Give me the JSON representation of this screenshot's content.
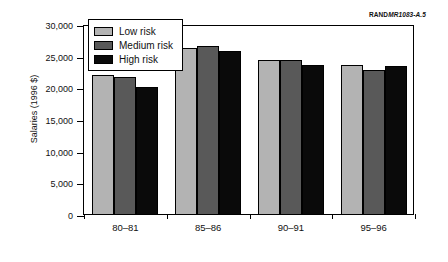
{
  "credit": {
    "publisher": "RAND",
    "code": "MR1083-A.5"
  },
  "legend": {
    "position": "top-left-inside",
    "items": [
      {
        "label": "Low risk",
        "color": "#b3b3b3"
      },
      {
        "label": "Medium risk",
        "color": "#595959"
      },
      {
        "label": "High risk",
        "color": "#0a0a0a"
      }
    ]
  },
  "yaxis": {
    "ticks": [
      "0",
      "5,000",
      "10,000",
      "15,000",
      "20,000",
      "25,000",
      "30,000"
    ]
  },
  "chart_data": {
    "type": "bar",
    "title": "",
    "xlabel": "",
    "ylabel": "Salaries (1996 $)",
    "categories": [
      "80–81",
      "85–86",
      "90–91",
      "95–96"
    ],
    "series": [
      {
        "name": "Low risk",
        "color": "#b3b3b3",
        "values": [
          22000,
          26200,
          24300,
          23500
        ]
      },
      {
        "name": "Medium risk",
        "color": "#595959",
        "values": [
          21600,
          26500,
          24300,
          22800
        ]
      },
      {
        "name": "High risk",
        "color": "#0a0a0a",
        "values": [
          20000,
          25800,
          23600,
          23400
        ]
      }
    ],
    "ylim": [
      0,
      30000
    ],
    "ytick_step": 5000,
    "grid": false,
    "legend_position": "upper left"
  }
}
